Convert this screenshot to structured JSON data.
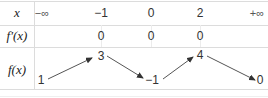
{
  "table": {
    "row_labels": {
      "x": "x",
      "fprime": "f′(x)",
      "f": "f(x)"
    },
    "x_values": [
      "−∞",
      "−1",
      "0",
      "2",
      "+∞"
    ],
    "fprime_values": [
      "0",
      "0",
      "0"
    ],
    "f_values": [
      "1",
      "3",
      "−1",
      "4",
      "0"
    ],
    "variations": [
      "increasing",
      "decreasing",
      "increasing",
      "decreasing"
    ]
  },
  "colors": {
    "border": "#dcdcdc",
    "text": "#2a2a2a",
    "arrow": "#333333"
  }
}
